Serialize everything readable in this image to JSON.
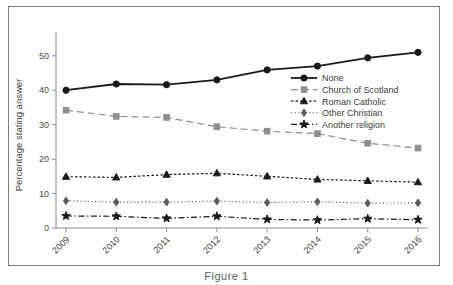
{
  "figure": {
    "caption": "Figure 1",
    "axis_y_title": "Percentage stating answer"
  },
  "chart_data": {
    "type": "line",
    "title": "",
    "xlabel": "",
    "ylabel": "Percentage stating answer",
    "categories": [
      "2009",
      "2010",
      "2011",
      "2012",
      "2013",
      "2014",
      "2015",
      "2016"
    ],
    "x": [
      2009,
      2010,
      2011,
      2012,
      2013,
      2014,
      2015,
      2016
    ],
    "ylim": [
      0,
      54
    ],
    "xlim": [
      2008.6,
      2016.6
    ],
    "yticks": [
      0,
      10,
      20,
      30,
      40,
      50
    ],
    "ytick_labels": [
      "0",
      "10",
      "20",
      "30",
      "40",
      "50"
    ],
    "grid": false,
    "legend_position": "center-right",
    "series": [
      {
        "name": "None",
        "values": [
          40.0,
          41.8,
          41.6,
          43.0,
          45.9,
          47.0,
          49.4,
          51.0
        ],
        "color": "#1a1a1a",
        "marker": "circle",
        "linestyle": "solid",
        "linewidth": 1.8
      },
      {
        "name": "Church of Scotland",
        "values": [
          34.2,
          32.4,
          32.1,
          29.4,
          28.1,
          27.4,
          24.6,
          23.2
        ],
        "color": "#8f8f8f",
        "marker": "square",
        "linestyle": "dashed",
        "linewidth": 1.2
      },
      {
        "name": "Roman Catholic",
        "values": [
          14.9,
          14.7,
          15.5,
          15.9,
          15.0,
          14.1,
          13.7,
          13.3
        ],
        "color": "#1a1a1a",
        "marker": "triangle",
        "linestyle": "dotted-dense",
        "linewidth": 1.2
      },
      {
        "name": "Other Christian",
        "values": [
          7.9,
          7.5,
          7.5,
          7.8,
          7.4,
          7.6,
          7.2,
          7.3
        ],
        "color": "#5c5c5c",
        "marker": "diamond",
        "linestyle": "dotted",
        "linewidth": 1.1
      },
      {
        "name": "Another religion",
        "values": [
          3.5,
          3.4,
          2.8,
          3.4,
          2.5,
          2.3,
          2.7,
          2.4
        ],
        "color": "#1a1a1a",
        "marker": "star",
        "linestyle": "dashdot",
        "linewidth": 1.2
      }
    ]
  },
  "legend": {
    "items": [
      {
        "label": "None"
      },
      {
        "label": "Church of Scotland"
      },
      {
        "label": "Roman Catholic"
      },
      {
        "label": "Other Christian"
      },
      {
        "label": "Another religion"
      }
    ]
  }
}
